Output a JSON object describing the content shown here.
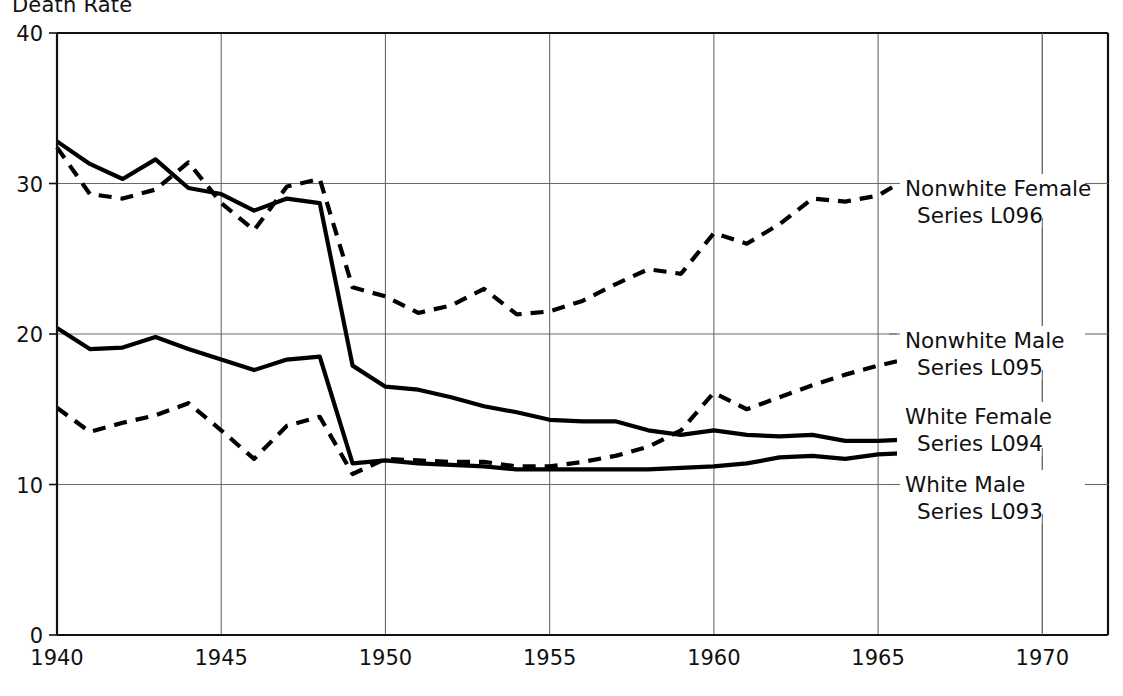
{
  "chart": {
    "title": "Death Rate",
    "y_axis": {
      "ticks": [
        "0",
        "10",
        "20",
        "30",
        "40"
      ]
    },
    "x_axis": {
      "ticks": [
        "1940",
        "1945",
        "1950",
        "1955",
        "1960",
        "1965",
        "1970"
      ]
    },
    "annotations": [
      {
        "line1": "Nonwhite Female",
        "line2": "Series L096"
      },
      {
        "line1": "Nonwhite Male",
        "line2": "Series L095"
      },
      {
        "line1": "White Female",
        "line2": "Series L094"
      },
      {
        "line1": "White Male",
        "line2": "Series L093"
      }
    ]
  },
  "chart_data": {
    "type": "line",
    "title": "Death Rate",
    "xlabel": "",
    "ylabel": "Death Rate",
    "xlim": [
      1940,
      1972
    ],
    "ylim": [
      0,
      40
    ],
    "xticks": [
      1940,
      1945,
      1950,
      1955,
      1960,
      1965,
      1970
    ],
    "yticks": [
      0,
      10,
      20,
      30,
      40
    ],
    "grid": true,
    "legend_position": "right-inline-annotations",
    "x": [
      1940,
      1941,
      1942,
      1943,
      1944,
      1945,
      1946,
      1947,
      1948,
      1949,
      1950,
      1951,
      1952,
      1953,
      1954,
      1955,
      1956,
      1957,
      1958,
      1959,
      1960,
      1961,
      1962,
      1963,
      1964,
      1965,
      1966,
      1967
    ],
    "series": [
      {
        "name": "Nonwhite Female Series L096",
        "style": "dashed",
        "values": [
          32.4,
          29.3,
          29.0,
          29.6,
          31.4,
          28.7,
          26.9,
          29.8,
          30.3,
          23.1,
          22.5,
          21.4,
          21.9,
          23.0,
          21.3,
          21.5,
          22.2,
          23.3,
          24.3,
          24.0,
          26.7,
          26.0,
          27.3,
          29.0,
          28.8,
          29.2,
          30.5,
          29.7
        ]
      },
      {
        "name": "Nonwhite Male Series L095",
        "style": "solid-then-dashed",
        "solid_values": [
          32.8,
          31.3,
          30.3,
          31.6,
          29.7,
          29.3,
          28.2,
          29.0,
          28.7,
          17.9,
          16.5,
          16.3,
          15.8,
          15.2,
          14.8,
          14.3,
          14.2,
          14.2,
          13.6,
          13.3,
          13.6,
          13.3,
          13.2,
          13.3,
          12.9,
          12.9,
          13.0,
          12.5
        ],
        "dashed_values": [
          15.1,
          13.5,
          14.1,
          14.6,
          15.4,
          13.6,
          11.7,
          13.9,
          14.5,
          10.7,
          11.7,
          11.6,
          11.5,
          11.5,
          11.2,
          11.2,
          11.5,
          11.9,
          12.5,
          13.6,
          16.1,
          15.0,
          15.8,
          16.6,
          17.3,
          17.9,
          18.4,
          18.7
        ]
      }
    ],
    "series_flat": [
      {
        "name": "Nonwhite Female Series L096",
        "code": "L096",
        "style": "dashed",
        "values": [
          32.4,
          29.3,
          29.0,
          29.6,
          31.4,
          28.7,
          26.9,
          29.8,
          30.3,
          23.1,
          22.5,
          21.4,
          21.9,
          23.0,
          21.3,
          21.5,
          22.2,
          23.3,
          24.3,
          24.0,
          26.7,
          26.0,
          27.3,
          29.0,
          28.8,
          29.2,
          30.5,
          29.7
        ]
      },
      {
        "name": "Nonwhite Male Series L095",
        "code": "L095",
        "style": "solid",
        "values": [
          32.8,
          31.3,
          30.3,
          31.6,
          29.7,
          29.3,
          28.2,
          29.0,
          28.7,
          17.9,
          16.5,
          16.3,
          15.8,
          15.2,
          14.8,
          14.3,
          14.2,
          14.2,
          13.6,
          13.3,
          13.6,
          13.3,
          13.2,
          13.3,
          12.9,
          12.9,
          13.0,
          12.5
        ]
      },
      {
        "name": "White Female Series L094",
        "code": "L094",
        "style": "dashed",
        "values": [
          15.1,
          13.5,
          14.1,
          14.6,
          15.4,
          13.6,
          11.7,
          13.9,
          14.5,
          10.7,
          11.7,
          11.6,
          11.5,
          11.5,
          11.2,
          11.2,
          11.5,
          11.9,
          12.5,
          13.6,
          16.1,
          15.0,
          15.8,
          16.6,
          17.3,
          17.9,
          18.4,
          18.7
        ]
      },
      {
        "name": "White Male Series L093",
        "code": "L093",
        "style": "solid",
        "values": [
          20.4,
          19.0,
          19.1,
          19.8,
          19.0,
          18.3,
          17.6,
          18.3,
          18.5,
          11.4,
          11.6,
          11.4,
          11.3,
          11.2,
          11.0,
          11.0,
          11.0,
          11.0,
          11.0,
          11.1,
          11.2,
          11.4,
          11.8,
          11.9,
          11.7,
          12.0,
          12.1,
          12.5
        ]
      }
    ]
  }
}
